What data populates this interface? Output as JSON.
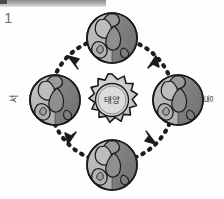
{
  "figure": {
    "number": "1",
    "title_region": "scan-bar"
  },
  "diagram": {
    "type": "earth-revolution-around-sun",
    "center_body": {
      "name": "sun",
      "label": "태양",
      "shape": "spiked-star",
      "fill_color": "#c9c9c9",
      "inner_fill_color": "#d5d5d5",
      "stroke_color": "#1a1a1a",
      "spike_count": 16
    },
    "orbit": {
      "style": "dashed",
      "shape": "circle",
      "direction": "counterclockwise",
      "dash_color": "#1c1c1c",
      "arrow_count": 4,
      "arrow_color": "#1c1c1c"
    },
    "earth_positions": [
      {
        "id": "earth-top",
        "position": "top",
        "lit_side": "left",
        "light_fill": "#b4b4b4",
        "dark_fill": "#787878",
        "stroke_color": "#1a1a1a"
      },
      {
        "id": "earth-right",
        "position": "right",
        "lit_side": "left",
        "light_fill": "#b4b4b4",
        "dark_fill": "#787878",
        "stroke_color": "#1a1a1a"
      },
      {
        "id": "earth-bottom",
        "position": "bottom",
        "lit_side": "left",
        "light_fill": "#b4b4b4",
        "dark_fill": "#787878",
        "stroke_color": "#1a1a1a"
      },
      {
        "id": "earth-left",
        "position": "left",
        "lit_side": "left",
        "light_fill": "#b4b4b4",
        "dark_fill": "#787878",
        "stroke_color": "#1a1a1a"
      }
    ],
    "direction_labels": {
      "west": "서",
      "east": "동"
    }
  },
  "colors": {
    "background": "#ffffff",
    "ink": "#1a1a1a",
    "scan_bar": "#a9a9a9",
    "figure_number": "#6e6e6e"
  }
}
